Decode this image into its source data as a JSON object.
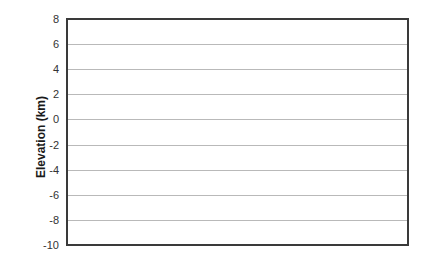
{
  "chart_data": {
    "type": "line",
    "title": "",
    "xlabel": "",
    "ylabel": "Elevation (km)",
    "ylim": [
      -10,
      8
    ],
    "yticks": [
      8,
      6,
      4,
      2,
      0,
      -2,
      -4,
      -6,
      -8,
      -10
    ],
    "ytick_labels": [
      "8",
      "6",
      "4",
      "2",
      "0",
      "-2",
      "-4",
      "-6",
      "-8",
      "-10"
    ],
    "xticks": [],
    "grid": true,
    "legend": null,
    "series": []
  },
  "labels": {
    "ylabel": "Elevation (km)"
  },
  "colors": {
    "frame": "#3a3a3a",
    "grid": "#b9b9b9",
    "text": "#333333"
  }
}
